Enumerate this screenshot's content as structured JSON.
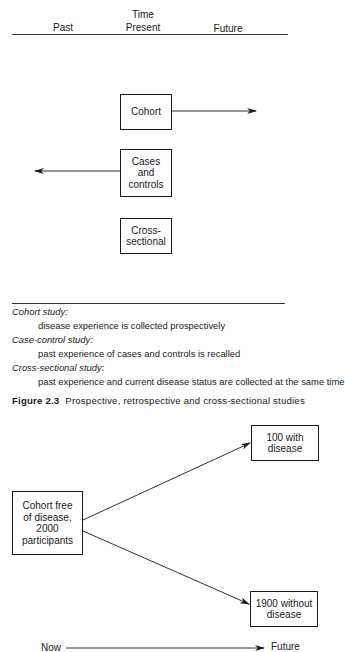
{
  "figure1": {
    "header": {
      "time_label": "Time",
      "past_label": "Past",
      "present_label": "Present",
      "future_label": "Future"
    },
    "boxes": {
      "cohort": "Cohort",
      "cases_controls": "Cases\nand\ncontrols",
      "cross_sectional": "Cross-\nsectional"
    },
    "arrows": [
      {
        "from": "cohort",
        "direction": "future"
      },
      {
        "from": "cases_controls",
        "direction": "past"
      }
    ],
    "legend": {
      "cohort_title": "Cohort study:",
      "cohort_desc": "disease experience is collected prospectively",
      "case_control_title": "Case-control study:",
      "case_control_desc": "past experience of cases and controls is recalled",
      "cross_sectional_title": "Cross-sectional study:",
      "cross_sectional_desc": "past experience and current disease status are collected at the same time"
    },
    "caption": {
      "label": "Figure 2.3",
      "text": "Prospective, retrospective and cross-sectional studies"
    }
  },
  "figure2": {
    "start_box": "Cohort free\nof disease,\n2000\nparticipants",
    "outcome_with": "100 with\ndisease",
    "outcome_without": "1900 without\ndisease",
    "timeline": {
      "now_label": "Now",
      "future_label": "Future"
    }
  }
}
